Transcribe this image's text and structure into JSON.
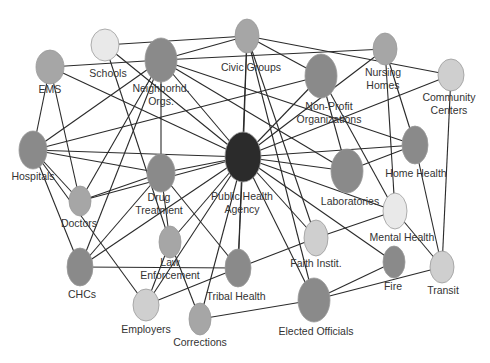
{
  "diagram": {
    "type": "network",
    "colors": {
      "center": "#2b2b2b",
      "dark": "#8a8a8a",
      "medium": "#a6a6a6",
      "light": "#cfcfcf",
      "lightest": "#e9e9e9",
      "edge": "#2a2a2a",
      "label": "#333333"
    },
    "nodes": [
      {
        "id": "ems",
        "label": [
          "EMS"
        ],
        "x": 50,
        "y": 67,
        "rx": 14,
        "ry": 17,
        "shade": "medium",
        "lx": 50,
        "ly": 93
      },
      {
        "id": "schools",
        "label": [
          "Schools"
        ],
        "x": 105,
        "y": 45,
        "rx": 14,
        "ry": 16,
        "shade": "lightest",
        "lx": 108,
        "ly": 77
      },
      {
        "id": "neighborhood",
        "label": [
          "Neighborhd.",
          "Orgs."
        ],
        "x": 161,
        "y": 60,
        "rx": 16,
        "ry": 22,
        "shade": "dark",
        "lx": 161,
        "ly": 92
      },
      {
        "id": "civic",
        "label": [
          "Civic Groups"
        ],
        "x": 247,
        "y": 36,
        "rx": 12,
        "ry": 17,
        "shade": "medium",
        "lx": 251,
        "ly": 71
      },
      {
        "id": "nonprofit",
        "label": [
          "Non-Profit",
          "Organizations"
        ],
        "x": 321,
        "y": 76,
        "rx": 16,
        "ry": 22,
        "shade": "dark",
        "lx": 329,
        "ly": 110
      },
      {
        "id": "nursing",
        "label": [
          "Nursing",
          "Homes"
        ],
        "x": 385,
        "y": 49,
        "rx": 12,
        "ry": 16,
        "shade": "medium",
        "lx": 383,
        "ly": 76
      },
      {
        "id": "community",
        "label": [
          "Community",
          "Centers"
        ],
        "x": 451,
        "y": 75,
        "rx": 13,
        "ry": 16,
        "shade": "light",
        "lx": 449,
        "ly": 101
      },
      {
        "id": "hospitals",
        "label": [
          "Hospitals"
        ],
        "x": 33,
        "y": 150,
        "rx": 14,
        "ry": 19,
        "shade": "dark",
        "lx": 33,
        "ly": 180
      },
      {
        "id": "doctors",
        "label": [
          "Doctors"
        ],
        "x": 80,
        "y": 201,
        "rx": 11,
        "ry": 15,
        "shade": "medium",
        "lx": 79,
        "ly": 227
      },
      {
        "id": "drug",
        "label": [
          "Drug",
          "Treatment"
        ],
        "x": 161,
        "y": 173,
        "rx": 14,
        "ry": 19,
        "shade": "dark",
        "lx": 159,
        "ly": 201
      },
      {
        "id": "pha",
        "label": [
          "Public Health",
          "Agency"
        ],
        "x": 243,
        "y": 157,
        "rx": 18,
        "ry": 25,
        "shade": "center",
        "lx": 242,
        "ly": 200
      },
      {
        "id": "labs",
        "label": [
          "Laboratories"
        ],
        "x": 347,
        "y": 171,
        "rx": 16,
        "ry": 22,
        "shade": "dark",
        "lx": 350,
        "ly": 205
      },
      {
        "id": "homehealth",
        "label": [
          "Home Health"
        ],
        "x": 415,
        "y": 145,
        "rx": 13,
        "ry": 19,
        "shade": "dark",
        "lx": 416,
        "ly": 177
      },
      {
        "id": "mental",
        "label": [
          "Mental Health"
        ],
        "x": 395,
        "y": 211,
        "rx": 12,
        "ry": 18,
        "shade": "lightest",
        "lx": 402,
        "ly": 241
      },
      {
        "id": "law",
        "label": [
          "Law",
          "Enforcement"
        ],
        "x": 170,
        "y": 242,
        "rx": 11,
        "ry": 16,
        "shade": "medium",
        "lx": 170,
        "ly": 266
      },
      {
        "id": "faith",
        "label": [
          "Faith Instit."
        ],
        "x": 316,
        "y": 238,
        "rx": 12,
        "ry": 18,
        "shade": "light",
        "lx": 316,
        "ly": 267
      },
      {
        "id": "chcs",
        "label": [
          "CHCs"
        ],
        "x": 80,
        "y": 267,
        "rx": 13,
        "ry": 19,
        "shade": "dark",
        "lx": 82,
        "ly": 298
      },
      {
        "id": "tribal",
        "label": [
          "Tribal Health"
        ],
        "x": 238,
        "y": 268,
        "rx": 13,
        "ry": 19,
        "shade": "dark",
        "lx": 236,
        "ly": 300
      },
      {
        "id": "fire",
        "label": [
          "Fire"
        ],
        "x": 394,
        "y": 262,
        "rx": 11,
        "ry": 16,
        "shade": "dark",
        "lx": 393,
        "ly": 290
      },
      {
        "id": "transit",
        "label": [
          "Transit"
        ],
        "x": 442,
        "y": 267,
        "rx": 12,
        "ry": 16,
        "shade": "light",
        "lx": 443,
        "ly": 294
      },
      {
        "id": "employers",
        "label": [
          "Employers"
        ],
        "x": 146,
        "y": 305,
        "rx": 13,
        "ry": 16,
        "shade": "light",
        "lx": 146,
        "ly": 333
      },
      {
        "id": "corrections",
        "label": [
          "Corrections"
        ],
        "x": 200,
        "y": 319,
        "rx": 11,
        "ry": 16,
        "shade": "medium",
        "lx": 200,
        "ly": 346
      },
      {
        "id": "elected",
        "label": [
          "Elected Officials"
        ],
        "x": 314,
        "y": 300,
        "rx": 16,
        "ry": 22,
        "shade": "dark",
        "lx": 316,
        "ly": 335
      }
    ],
    "edges": [
      [
        "schools",
        "civic"
      ],
      [
        "ems",
        "neighborhood"
      ],
      [
        "neighborhood",
        "civic"
      ],
      [
        "neighborhood",
        "nursing"
      ],
      [
        "civic",
        "community"
      ],
      [
        "nonprofit",
        "hospitals"
      ],
      [
        "nonprofit",
        "pha"
      ],
      [
        "nursing",
        "pha"
      ],
      [
        "ems",
        "hospitals"
      ],
      [
        "ems",
        "doctors"
      ],
      [
        "ems",
        "pha"
      ],
      [
        "schools",
        "pha"
      ],
      [
        "schools",
        "law"
      ],
      [
        "neighborhood",
        "hospitals"
      ],
      [
        "neighborhood",
        "doctors"
      ],
      [
        "neighborhood",
        "chcs"
      ],
      [
        "neighborhood",
        "drug"
      ],
      [
        "neighborhood",
        "pha"
      ],
      [
        "neighborhood",
        "labs"
      ],
      [
        "neighborhood",
        "homehealth"
      ],
      [
        "civic",
        "pha"
      ],
      [
        "civic",
        "faith"
      ],
      [
        "civic",
        "tribal"
      ],
      [
        "civic",
        "elected"
      ],
      [
        "civic",
        "nonprofit"
      ],
      [
        "nonprofit",
        "labs"
      ],
      [
        "nursing",
        "homehealth"
      ],
      [
        "nursing",
        "mental"
      ],
      [
        "community",
        "pha"
      ],
      [
        "community",
        "transit"
      ],
      [
        "hospitals",
        "doctors"
      ],
      [
        "hospitals",
        "pha"
      ],
      [
        "hospitals",
        "drug"
      ],
      [
        "hospitals",
        "chcs"
      ],
      [
        "hospitals",
        "employers"
      ],
      [
        "doctors",
        "pha"
      ],
      [
        "doctors",
        "drug"
      ],
      [
        "drug",
        "pha"
      ],
      [
        "drug",
        "law"
      ],
      [
        "drug",
        "chcs"
      ],
      [
        "drug",
        "tribal"
      ],
      [
        "pha",
        "labs"
      ],
      [
        "pha",
        "homehealth"
      ],
      [
        "pha",
        "mental"
      ],
      [
        "pha",
        "faith"
      ],
      [
        "pha",
        "fire"
      ],
      [
        "pha",
        "tribal"
      ],
      [
        "pha",
        "law"
      ],
      [
        "pha",
        "chcs"
      ],
      [
        "pha",
        "corrections"
      ],
      [
        "pha",
        "elected"
      ],
      [
        "pha",
        "employers"
      ],
      [
        "labs",
        "homehealth"
      ],
      [
        "mental",
        "faith"
      ],
      [
        "mental",
        "transit"
      ],
      [
        "homehealth",
        "transit"
      ],
      [
        "law",
        "corrections"
      ],
      [
        "law",
        "employers"
      ],
      [
        "chcs",
        "tribal"
      ],
      [
        "tribal",
        "employers"
      ],
      [
        "tribal",
        "faith"
      ],
      [
        "corrections",
        "elected"
      ],
      [
        "elected",
        "fire"
      ],
      [
        "elected",
        "transit"
      ],
      [
        "nonprofit",
        "mental"
      ]
    ]
  }
}
